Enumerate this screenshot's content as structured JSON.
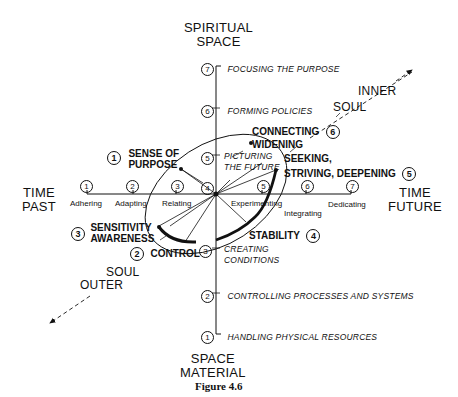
{
  "axes": {
    "vertical_top": [
      "SPIRITUAL",
      "SPACE"
    ],
    "vertical_bottom": [
      "SPACE",
      "MATERIAL"
    ],
    "horizontal_left": [
      "TIME",
      "PAST"
    ],
    "horizontal_right": [
      "TIME",
      "FUTURE"
    ],
    "diagonal_upper": [
      "INNER",
      "SOUL"
    ],
    "diagonal_lower": [
      "SOUL",
      "OUTER"
    ]
  },
  "vertical_levels": [
    {
      "num": "7",
      "label": "FOCUSING THE PURPOSE"
    },
    {
      "num": "6",
      "label": "FORMING POLICIES"
    },
    {
      "num": "5",
      "label": "PICTURING",
      "label2": "THE FUTURE"
    },
    {
      "num": "4",
      "label": ""
    },
    {
      "num": "3",
      "label": "CREATING",
      "label2": "CONDITIONS"
    },
    {
      "num": "2",
      "label": "CONTROLLING PROCESSES AND SYSTEMS"
    },
    {
      "num": "1",
      "label": "HANDLING PHYSICAL RESOURCES"
    }
  ],
  "horizontal_levels": [
    {
      "num": "1",
      "label": "Adhering"
    },
    {
      "num": "2",
      "label": "Adapting"
    },
    {
      "num": "3",
      "label": "Relating"
    },
    {
      "num": "5",
      "label": "Experimenting"
    },
    {
      "num": "6",
      "label": "Integrating"
    },
    {
      "num": "7",
      "label": "Dedicating"
    }
  ],
  "stages": [
    {
      "num": "1",
      "label": "SENSE OF",
      "label2": "PURPOSE"
    },
    {
      "num": "2",
      "label": "CONTROL"
    },
    {
      "num": "3",
      "label": "SENSITIVITY",
      "label2": "AWARENESS"
    },
    {
      "num": "4",
      "label": "STABILITY"
    },
    {
      "num": "5",
      "label": "SEEKING,",
      "label2": "STRIVING, DEEPENING"
    },
    {
      "num": "6",
      "label": "CONNECTING",
      "label2": "WIDENING"
    }
  ],
  "caption": "Figure 4.6"
}
